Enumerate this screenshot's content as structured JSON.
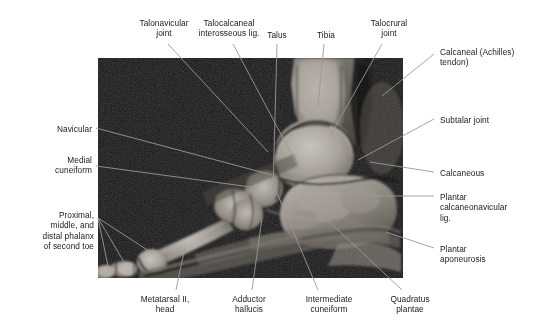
{
  "figure": {
    "type": "anatomical-mri-figure",
    "modality": "MRI",
    "view": "sagittal section of the foot and ankle",
    "panel": {
      "x": 98,
      "y": 58,
      "width": 305,
      "height": 220,
      "background": "#0a0a0a"
    },
    "leader_line_color": "#9a9a9a",
    "text_color": "#1a1a1a",
    "background": "#ffffff"
  },
  "labels": [
    {
      "id": "talonavicular-joint",
      "text": "Talonavicular\njoint",
      "align": "center",
      "x": 118,
      "y": 18,
      "w": 92,
      "anchor": [
        268,
        152
      ]
    },
    {
      "id": "talocalcaneal-lig",
      "text": "Talocalcaneal\ninterosseous lig.",
      "align": "center",
      "x": 175,
      "y": 18,
      "w": 108,
      "anchor": [
        300,
        170
      ]
    },
    {
      "id": "talus",
      "text": "Talus",
      "align": "center",
      "x": 254,
      "y": 30,
      "w": 46,
      "anchor": [
        273,
        190
      ]
    },
    {
      "id": "tibia",
      "text": "Tibia",
      "align": "center",
      "x": 305,
      "y": 30,
      "w": 42,
      "anchor": [
        318,
        106
      ]
    },
    {
      "id": "talocrural-joint",
      "text": "Talocrural\njoint",
      "align": "center",
      "x": 352,
      "y": 18,
      "w": 74,
      "anchor": [
        330,
        136
      ]
    },
    {
      "id": "calcaneal-achilles-tendon",
      "text": "Calcaneal (Achilles)\ntendon)",
      "align": "left",
      "x": 440,
      "y": 47,
      "w": 106,
      "anchor": [
        382,
        96
      ]
    },
    {
      "id": "subtalar-joint",
      "text": "Subtalar joint",
      "align": "left",
      "x": 440,
      "y": 115,
      "w": 96,
      "anchor": [
        358,
        160
      ]
    },
    {
      "id": "calcaneous",
      "text": "Calcaneous",
      "align": "left",
      "x": 440,
      "y": 168,
      "w": 96,
      "anchor": [
        370,
        162
      ]
    },
    {
      "id": "plantar-calcaneonavicular-lig",
      "text": "Plantar\ncalcaneonavicular\nlig.",
      "align": "left",
      "x": 440,
      "y": 192,
      "w": 104,
      "anchor": [
        330,
        196
      ]
    },
    {
      "id": "plantar-aponeurosis",
      "text": "Plantar\naponeurosis",
      "align": "left",
      "x": 440,
      "y": 244,
      "w": 96,
      "anchor": [
        386,
        232
      ]
    },
    {
      "id": "navicular",
      "text": "Navicular",
      "align": "right",
      "x": 8,
      "y": 124,
      "w": 84,
      "anchor": [
        272,
        175
      ]
    },
    {
      "id": "medial-cuneiform",
      "text": "Medial\ncuneiform",
      "align": "right",
      "x": 8,
      "y": 155,
      "w": 84,
      "anchor": [
        258,
        188
      ]
    },
    {
      "id": "proximal-middle-distal-phalanx",
      "text": "Proximal,\nmiddle, and\ndistal phalanx\nof second toe",
      "align": "right",
      "x": 4,
      "y": 210,
      "w": 90,
      "anchor": [
        152,
        253
      ]
    },
    {
      "id": "metatarsal-ii-head",
      "text": "Metatarsal II,\nhead",
      "align": "center",
      "x": 122,
      "y": 294,
      "w": 86,
      "anchor": [
        185,
        247
      ]
    },
    {
      "id": "adductor-hallucis",
      "text": "Adductor\nhallucis",
      "align": "center",
      "x": 213,
      "y": 294,
      "w": 72,
      "anchor": [
        262,
        218
      ]
    },
    {
      "id": "intermediate-cuneiform",
      "text": "Intermediate\ncuneiform",
      "align": "center",
      "x": 285,
      "y": 294,
      "w": 88,
      "anchor": [
        277,
        193
      ]
    },
    {
      "id": "quadratus-plantae",
      "text": "Quadratus\nplantae",
      "align": "center",
      "x": 372,
      "y": 294,
      "w": 76,
      "anchor": [
        303,
        197
      ]
    }
  ]
}
